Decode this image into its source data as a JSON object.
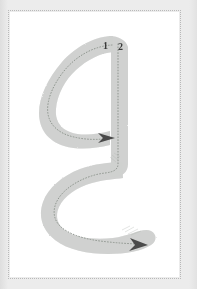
{
  "panel": {
    "background_color": "#ffffff",
    "border_color": "#b9b9b9",
    "border_style": "dotted",
    "outer_background_color": "#e9e9e9"
  },
  "glyph": {
    "description": "handwriting stroke-order guide glyph",
    "fill_color": "#cfd1cf",
    "guide_path_color": "#9aa09a",
    "arrow_color": "#4a4a4a"
  },
  "stroke_order": {
    "labels": [
      {
        "id": "1",
        "text": "1"
      },
      {
        "id": "2",
        "text": "2"
      }
    ],
    "label_color": "#3a3a3a"
  },
  "arrows": [
    {
      "id": "arrow-stroke-1",
      "direction": "right"
    },
    {
      "id": "arrow-stroke-2",
      "direction": "right"
    }
  ]
}
